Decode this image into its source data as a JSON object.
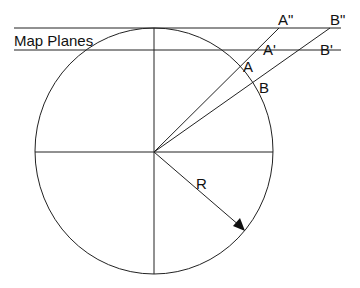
{
  "diagram": {
    "title_label": "Map Planes",
    "points": {
      "A": "A",
      "B": "B",
      "A_prime": "A'",
      "B_prime": "B'",
      "A_double_prime": "A\"",
      "B_double_prime": "B\""
    },
    "radius_label": "R",
    "colors": {
      "line": "#222222",
      "background": "#ffffff"
    }
  }
}
